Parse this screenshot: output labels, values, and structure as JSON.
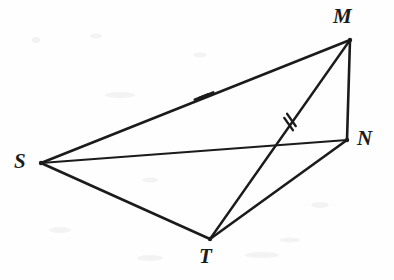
{
  "figure": {
    "type": "geometry-diagram",
    "width": 394,
    "height": 280,
    "background_color": "#fefefe",
    "stroke_color": "#1b1b1b",
    "vertices": [
      {
        "id": "S",
        "label": "S",
        "x": 41,
        "y": 163,
        "label_x": 14,
        "label_y": 151
      },
      {
        "id": "M",
        "label": "M",
        "x": 350,
        "y": 40,
        "label_x": 333,
        "label_y": 6
      },
      {
        "id": "N",
        "label": "N",
        "x": 347,
        "y": 140,
        "label_x": 357,
        "label_y": 128
      },
      {
        "id": "T",
        "label": "T",
        "x": 210,
        "y": 239,
        "label_x": 199,
        "label_y": 246
      }
    ],
    "segments": [
      {
        "id": "SM",
        "from": "S",
        "to": "M",
        "x1": 41,
        "y1": 163,
        "x2": 350,
        "y2": 40,
        "width": 2.6
      },
      {
        "id": "SN",
        "from": "S",
        "to": "N",
        "x1": 41,
        "y1": 163,
        "x2": 347,
        "y2": 140,
        "width": 2.0
      },
      {
        "id": "ST",
        "from": "S",
        "to": "T",
        "x1": 41,
        "y1": 163,
        "x2": 210,
        "y2": 239,
        "width": 2.6
      },
      {
        "id": "MN",
        "from": "M",
        "to": "N",
        "x1": 350,
        "y1": 40,
        "x2": 347,
        "y2": 140,
        "width": 2.6
      },
      {
        "id": "MT",
        "from": "M",
        "to": "T",
        "x1": 350,
        "y1": 40,
        "x2": 210,
        "y2": 239,
        "width": 2.4
      },
      {
        "id": "NT",
        "from": "N",
        "to": "T",
        "x1": 347,
        "y1": 140,
        "x2": 210,
        "y2": 239,
        "width": 2.6
      }
    ],
    "tick_marks": [
      {
        "id": "tick-SM",
        "on_segment": "SM",
        "kind": "double-hash",
        "count": 2,
        "x": 204,
        "y": 96,
        "angle_deg": -21.7,
        "length": 15,
        "spacing": 5
      },
      {
        "id": "tick-MT",
        "on_segment": "MT",
        "kind": "double-hash",
        "count": 2,
        "x": 290,
        "y": 122,
        "angle_deg": 54.9,
        "length": 15,
        "spacing": 5
      }
    ],
    "intersections": [
      {
        "id": "SN-MT",
        "segments": [
          "SN",
          "MT"
        ],
        "x": 272,
        "y": 148
      }
    ],
    "speckles": [
      {
        "x": 36,
        "y": 40,
        "w": 9,
        "h": 6
      },
      {
        "x": 96,
        "y": 36,
        "w": 12,
        "h": 5
      },
      {
        "x": 120,
        "y": 95,
        "w": 30,
        "h": 6
      },
      {
        "x": 60,
        "y": 230,
        "w": 22,
        "h": 6
      },
      {
        "x": 150,
        "y": 258,
        "w": 26,
        "h": 6
      },
      {
        "x": 262,
        "y": 255,
        "w": 34,
        "h": 6
      },
      {
        "x": 320,
        "y": 205,
        "w": 18,
        "h": 6
      },
      {
        "x": 150,
        "y": 180,
        "w": 16,
        "h": 5
      },
      {
        "x": 200,
        "y": 55,
        "w": 14,
        "h": 5
      },
      {
        "x": 290,
        "y": 240,
        "w": 20,
        "h": 5
      }
    ]
  }
}
